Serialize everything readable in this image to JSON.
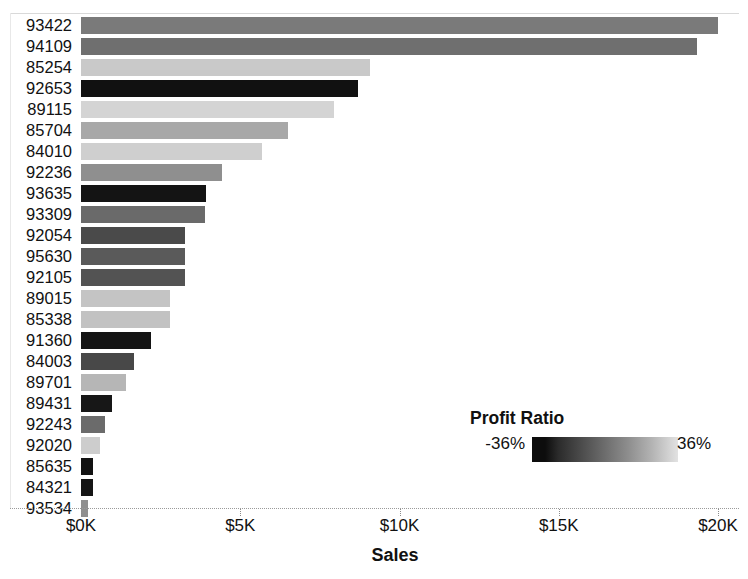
{
  "chart_data": {
    "type": "bar",
    "orientation": "horizontal",
    "title": "",
    "xlabel": "Sales",
    "ylabel": "",
    "xlim": [
      0,
      20000
    ],
    "xticks": [
      0,
      5000,
      10000,
      15000,
      20000
    ],
    "xticklabels": [
      "$0K",
      "$5K",
      "$10K",
      "$15K",
      "$20K"
    ],
    "grid": false,
    "categories": [
      "93422",
      "94109",
      "85254",
      "92653",
      "89115",
      "85704",
      "84010",
      "92236",
      "93635",
      "93309",
      "92054",
      "95630",
      "92105",
      "89015",
      "85338",
      "91360",
      "84003",
      "89701",
      "89431",
      "92243",
      "92020",
      "85635",
      "84321",
      "93534"
    ],
    "values": [
      20000,
      19340,
      9070,
      8700,
      7940,
      6500,
      5680,
      4430,
      3930,
      3900,
      3270,
      3260,
      3250,
      2790,
      2790,
      2200,
      1660,
      1410,
      970,
      750,
      600,
      380,
      370,
      220
    ],
    "series": [
      {
        "name": "Sales",
        "values": [
          20000,
          19340,
          9070,
          8700,
          7940,
          6500,
          5680,
          4430,
          3930,
          3900,
          3270,
          3260,
          3250,
          2790,
          2790,
          2200,
          1660,
          1410,
          970,
          750,
          600,
          380,
          370,
          220
        ]
      }
    ],
    "color_encoding": {
      "field": "Profit Ratio",
      "min_label": "-36%",
      "max_label": "36%",
      "min_value": -0.36,
      "max_value": 0.36,
      "ramp_dark": "#0d0d0d",
      "ramp_light": "#e2e2e2"
    },
    "bar_colors": [
      "#7a7a7a",
      "#6f6f6f",
      "#c9c9c9",
      "#111111",
      "#d4d4d4",
      "#a8a8a8",
      "#cfcfcf",
      "#8f8f8f",
      "#141414",
      "#6a6a6a",
      "#4a4a4a",
      "#5a5a5a",
      "#535353",
      "#c4c4c4",
      "#c2c2c2",
      "#141414",
      "#484848",
      "#b6b6b6",
      "#171717",
      "#6b6b6b",
      "#cdcdcd",
      "#121212",
      "#151515",
      "#909090"
    ],
    "profit_ratios": [
      -0.02,
      0.01,
      0.26,
      -0.35,
      0.3,
      0.15,
      0.28,
      0.06,
      -0.34,
      0.02,
      -0.1,
      -0.06,
      -0.08,
      0.25,
      0.24,
      -0.34,
      -0.11,
      0.21,
      -0.33,
      0.02,
      0.27,
      -0.35,
      -0.34,
      0.07
    ]
  },
  "axis": {
    "x_title": "Sales",
    "ticks": [
      {
        "label": "$0K",
        "value": 0
      },
      {
        "label": "$5K",
        "value": 5000
      },
      {
        "label": "$10K",
        "value": 10000
      },
      {
        "label": "$15K",
        "value": 15000
      },
      {
        "label": "$20K",
        "value": 20000
      }
    ]
  },
  "legend": {
    "title": "Profit Ratio",
    "min_label": "-36%",
    "max_label": "36%"
  }
}
